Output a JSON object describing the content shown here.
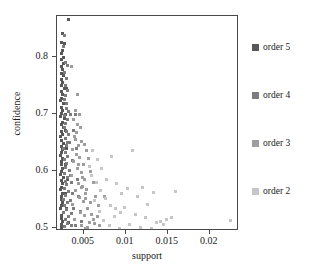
{
  "chart_data": {
    "type": "scatter",
    "title": "",
    "xlabel": "support",
    "ylabel": "confidence",
    "xlim": [
      0.0018,
      0.0235
    ],
    "ylim": [
      0.495,
      0.872
    ],
    "xticks": [
      "0.005",
      "0.01",
      "0.015",
      "0.02"
    ],
    "xtick_values": [
      0.005,
      0.01,
      0.015,
      0.02
    ],
    "yticks": [
      "0.5",
      "0.6",
      "0.7",
      "0.8"
    ],
    "ytick_values": [
      0.5,
      0.6,
      0.7,
      0.8
    ],
    "grid": false,
    "legend_position": "right",
    "marker": "square",
    "series": [
      {
        "name": "order 5",
        "color": "#585858",
        "points": [
          [
            0.00315,
            0.866
          ],
          [
            0.00245,
            0.842
          ],
          [
            0.00232,
            0.826
          ],
          [
            0.00268,
            0.823
          ],
          [
            0.0024,
            0.812
          ],
          [
            0.00228,
            0.806
          ],
          [
            0.00252,
            0.8
          ],
          [
            0.00236,
            0.795
          ],
          [
            0.00261,
            0.789
          ],
          [
            0.00228,
            0.784
          ],
          [
            0.00243,
            0.778
          ],
          [
            0.00233,
            0.772
          ],
          [
            0.00256,
            0.767
          ],
          [
            0.00229,
            0.761
          ],
          [
            0.00241,
            0.756
          ],
          [
            0.00235,
            0.75
          ],
          [
            0.00268,
            0.745
          ],
          [
            0.0023,
            0.739
          ],
          [
            0.00248,
            0.734
          ],
          [
            0.00237,
            0.728
          ],
          [
            0.00226,
            0.723
          ],
          [
            0.00259,
            0.718
          ],
          [
            0.00231,
            0.712
          ],
          [
            0.00244,
            0.707
          ],
          [
            0.00234,
            0.701
          ],
          [
            0.00225,
            0.696
          ],
          [
            0.00272,
            0.692
          ],
          [
            0.0024,
            0.686
          ],
          [
            0.00228,
            0.681
          ],
          [
            0.00253,
            0.676
          ],
          [
            0.00232,
            0.67
          ],
          [
            0.00246,
            0.665
          ],
          [
            0.00227,
            0.66
          ],
          [
            0.00238,
            0.654
          ],
          [
            0.00262,
            0.649
          ],
          [
            0.00229,
            0.643
          ],
          [
            0.00243,
            0.638
          ],
          [
            0.00231,
            0.632
          ],
          [
            0.00225,
            0.627
          ],
          [
            0.00251,
            0.622
          ],
          [
            0.00236,
            0.616
          ],
          [
            0.00228,
            0.611
          ],
          [
            0.0024,
            0.605
          ],
          [
            0.00233,
            0.6
          ],
          [
            0.00226,
            0.594
          ],
          [
            0.00258,
            0.589
          ],
          [
            0.0023,
            0.583
          ],
          [
            0.00245,
            0.578
          ],
          [
            0.00234,
            0.572
          ],
          [
            0.00227,
            0.567
          ],
          [
            0.00249,
            0.561
          ],
          [
            0.00237,
            0.556
          ],
          [
            0.00229,
            0.55
          ],
          [
            0.00242,
            0.545
          ],
          [
            0.00232,
            0.539
          ],
          [
            0.00225,
            0.534
          ],
          [
            0.00255,
            0.528
          ],
          [
            0.00235,
            0.523
          ],
          [
            0.00228,
            0.517
          ],
          [
            0.00247,
            0.512
          ],
          [
            0.00231,
            0.506
          ],
          [
            0.00239,
            0.501
          ],
          [
            0.0029,
            0.745
          ],
          [
            0.00283,
            0.7
          ],
          [
            0.00276,
            0.672
          ],
          [
            0.00298,
            0.64
          ],
          [
            0.00287,
            0.612
          ],
          [
            0.00305,
            0.585
          ],
          [
            0.00279,
            0.56
          ],
          [
            0.00296,
            0.535
          ],
          [
            0.00312,
            0.51
          ],
          [
            0.00265,
            0.503
          ]
        ]
      },
      {
        "name": "order 4",
        "color": "#7d7d7d",
        "points": [
          [
            0.00272,
            0.838
          ],
          [
            0.00258,
            0.818
          ],
          [
            0.00284,
            0.79
          ],
          [
            0.003,
            0.786
          ],
          [
            0.00265,
            0.773
          ],
          [
            0.00292,
            0.762
          ],
          [
            0.00276,
            0.75
          ],
          [
            0.0031,
            0.741
          ],
          [
            0.00281,
            0.733
          ],
          [
            0.00264,
            0.726
          ],
          [
            0.00297,
            0.719
          ],
          [
            0.00288,
            0.71
          ],
          [
            0.00322,
            0.704
          ],
          [
            0.0027,
            0.698
          ],
          [
            0.00303,
            0.691
          ],
          [
            0.00285,
            0.684
          ],
          [
            0.00338,
            0.7
          ],
          [
            0.00267,
            0.677
          ],
          [
            0.00294,
            0.67
          ],
          [
            0.00316,
            0.664
          ],
          [
            0.00279,
            0.658
          ],
          [
            0.00307,
            0.651
          ],
          [
            0.0029,
            0.645
          ],
          [
            0.00262,
            0.639
          ],
          [
            0.0033,
            0.65
          ],
          [
            0.00283,
            0.632
          ],
          [
            0.00311,
            0.626
          ],
          [
            0.00271,
            0.62
          ],
          [
            0.00299,
            0.613
          ],
          [
            0.00286,
            0.607
          ],
          [
            0.00325,
            0.601
          ],
          [
            0.00266,
            0.595
          ],
          [
            0.00304,
            0.588
          ],
          [
            0.00278,
            0.582
          ],
          [
            0.00342,
            0.592
          ],
          [
            0.00293,
            0.576
          ],
          [
            0.00268,
            0.57
          ],
          [
            0.00318,
            0.564
          ],
          [
            0.00287,
            0.557
          ],
          [
            0.0026,
            0.551
          ],
          [
            0.00308,
            0.545
          ],
          [
            0.00275,
            0.539
          ],
          [
            0.00335,
            0.548
          ],
          [
            0.00295,
            0.533
          ],
          [
            0.00263,
            0.527
          ],
          [
            0.0032,
            0.521
          ],
          [
            0.00282,
            0.515
          ],
          [
            0.00355,
            0.525
          ],
          [
            0.00301,
            0.509
          ],
          [
            0.0027,
            0.503
          ],
          [
            0.00348,
            0.505
          ],
          [
            0.00368,
            0.618
          ],
          [
            0.00382,
            0.672
          ],
          [
            0.00395,
            0.7
          ],
          [
            0.0041,
            0.64
          ],
          [
            0.00425,
            0.586
          ],
          [
            0.0044,
            0.556
          ],
          [
            0.00458,
            0.53
          ],
          [
            0.00472,
            0.512
          ],
          [
            0.00363,
            0.56
          ],
          [
            0.00376,
            0.534
          ],
          [
            0.0039,
            0.516
          ],
          [
            0.00352,
            0.58
          ],
          [
            0.00404,
            0.505
          ]
        ]
      },
      {
        "name": "order 3",
        "color": "#9e9e9e",
        "points": [
          [
            0.00352,
            0.783
          ],
          [
            0.0042,
            0.735
          ],
          [
            0.00398,
            0.706
          ],
          [
            0.00445,
            0.7
          ],
          [
            0.00372,
            0.69
          ],
          [
            0.0046,
            0.676
          ],
          [
            0.00408,
            0.668
          ],
          [
            0.00385,
            0.661
          ],
          [
            0.00478,
            0.652
          ],
          [
            0.00432,
            0.645
          ],
          [
            0.00365,
            0.638
          ],
          [
            0.00502,
            0.646
          ],
          [
            0.00415,
            0.63
          ],
          [
            0.00452,
            0.624
          ],
          [
            0.0038,
            0.617
          ],
          [
            0.0053,
            0.636
          ],
          [
            0.00492,
            0.611
          ],
          [
            0.00425,
            0.604
          ],
          [
            0.00468,
            0.598
          ],
          [
            0.00358,
            0.592
          ],
          [
            0.00555,
            0.622
          ],
          [
            0.0051,
            0.586
          ],
          [
            0.00438,
            0.579
          ],
          [
            0.00482,
            0.573
          ],
          [
            0.00395,
            0.566
          ],
          [
            0.0058,
            0.6
          ],
          [
            0.00522,
            0.56
          ],
          [
            0.0045,
            0.554
          ],
          [
            0.00496,
            0.547
          ],
          [
            0.0037,
            0.541
          ],
          [
            0.0061,
            0.58
          ],
          [
            0.0054,
            0.535
          ],
          [
            0.00462,
            0.528
          ],
          [
            0.00505,
            0.522
          ],
          [
            0.00388,
            0.516
          ],
          [
            0.0064,
            0.556
          ],
          [
            0.00565,
            0.51
          ],
          [
            0.00475,
            0.504
          ],
          [
            0.00518,
            0.5
          ],
          [
            0.00672,
            0.54
          ],
          [
            0.00592,
            0.524
          ],
          [
            0.007,
            0.566
          ],
          [
            0.00628,
            0.508
          ],
          [
            0.00548,
            0.502
          ],
          [
            0.0066,
            0.52
          ],
          [
            0.00745,
            0.555
          ],
          [
            0.00688,
            0.504
          ],
          [
            0.00615,
            0.515
          ],
          [
            0.00575,
            0.545
          ],
          [
            0.00533,
            0.568
          ],
          [
            0.00488,
            0.588
          ],
          [
            0.00442,
            0.612
          ],
          [
            0.00405,
            0.655
          ],
          [
            0.0043,
            0.681
          ],
          [
            0.0047,
            0.572
          ],
          [
            0.00515,
            0.552
          ]
        ]
      },
      {
        "name": "order 2",
        "color": "#c6c6c6",
        "points": [
          [
            0.00605,
            0.636
          ],
          [
            0.00658,
            0.62
          ],
          [
            0.00712,
            0.604
          ],
          [
            0.0077,
            0.586
          ],
          [
            0.00835,
            0.625
          ],
          [
            0.00892,
            0.578
          ],
          [
            0.00945,
            0.56
          ],
          [
            0.01015,
            0.57
          ],
          [
            0.0108,
            0.637
          ],
          [
            0.01135,
            0.556
          ],
          [
            0.01195,
            0.572
          ],
          [
            0.0126,
            0.542
          ],
          [
            0.0133,
            0.562
          ],
          [
            0.01415,
            0.512
          ],
          [
            0.0148,
            0.516
          ],
          [
            0.01595,
            0.564
          ],
          [
            0.00622,
            0.548
          ],
          [
            0.00684,
            0.53
          ],
          [
            0.0074,
            0.514
          ],
          [
            0.00805,
            0.505
          ],
          [
            0.00865,
            0.52
          ],
          [
            0.00925,
            0.5
          ],
          [
            0.00988,
            0.536
          ],
          [
            0.01048,
            0.506
          ],
          [
            0.01112,
            0.524
          ],
          [
            0.01172,
            0.502
          ],
          [
            0.01238,
            0.518
          ],
          [
            0.01305,
            0.5
          ],
          [
            0.01372,
            0.51
          ],
          [
            0.0145,
            0.506
          ],
          [
            0.0154,
            0.518
          ],
          [
            0.0225,
            0.513
          ],
          [
            0.00648,
            0.58
          ],
          [
            0.00702,
            0.566
          ],
          [
            0.00758,
            0.552
          ],
          [
            0.00818,
            0.54
          ],
          [
            0.00878,
            0.534
          ],
          [
            0.00938,
            0.528
          ],
          [
            0.00568,
            0.608
          ],
          [
            0.00592,
            0.592
          ]
        ]
      }
    ]
  },
  "legend": {
    "items": [
      {
        "label": "order 5",
        "color": "#585858"
      },
      {
        "label": "order 4",
        "color": "#7d7d7d"
      },
      {
        "label": "order 3",
        "color": "#9e9e9e"
      },
      {
        "label": "order 2",
        "color": "#c6c6c6"
      }
    ]
  }
}
